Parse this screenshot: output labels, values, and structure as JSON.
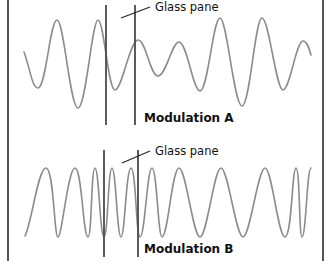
{
  "colors": {
    "background": "#ffffff",
    "frame": "#555555",
    "wave": "#8c8c8c",
    "glass": "#4a4a4a",
    "text": "#111111"
  },
  "panels": [
    {
      "id": "A",
      "glass_label": "Glass pane",
      "title": "Modulation A",
      "wave_path": "M24,52 C30,68 32,88 38,88 C46,88 50,20 57,20 C64,20 70,108 78,108 C86,108 92,20 98,20 C104,20 108,90 115,90 C122,90 130,40 138,40 C146,40 150,76 158,76 C166,76 172,42 179,42 C187,42 193,91 200,91 C208,91 213,18 220,18 C227,18 234,106 242,106 C250,106 255,18 262,18 C269,18 276,90 283,90 C290,90 296,41 303,41 C307,41 309,48 311,55",
      "glass_lines": [
        {
          "x": 106,
          "y1": 5,
          "y2": 125
        },
        {
          "x": 135,
          "y1": 5,
          "y2": 125
        }
      ],
      "leader": {
        "x1": 121,
        "y1": 18,
        "x2": 150,
        "y2": 7
      },
      "glass_label_pos": {
        "x": 155,
        "y": 11
      },
      "title_pos": {
        "x": 144,
        "y": 122
      }
    },
    {
      "id": "B",
      "glass_label": "Glass pane",
      "title": "Modulation B",
      "wave_path": "M25,236 C32,222 38,168 46,168 C54,168 54,237 58,237 C62,237 68,168 75,168 C82,168 83,237 88,237 C92,237 91,168 95,168 C99,168 100,237 104,237 C108,237 108,168 112,168 C116,168 117,237 121,237 C125,237 126,168 131,168 C136,168 136,237 140,237 C145,237 147,168 152,168 C157,168 158,237 162,237 C168,237 172,168 179,168 C186,168 193,237 200,237 C207,237 214,168 221,168 C228,168 236,237 243,237 C250,237 258,168 265,168 C272,168 278,237 285,237 C292,237 292,168 296,168 C300,168 299,237 302,237 C306,237 307,168 311,168",
      "glass_lines": [
        {
          "x": 104,
          "y1": 150,
          "y2": 257
        },
        {
          "x": 138,
          "y1": 150,
          "y2": 257
        }
      ],
      "leader": {
        "x1": 122,
        "y1": 163,
        "x2": 150,
        "y2": 151
      },
      "glass_label_pos": {
        "x": 155,
        "y": 155
      },
      "title_pos": {
        "x": 144,
        "y": 253
      }
    }
  ],
  "frame": {
    "left_x": 8,
    "right_x": 323
  }
}
